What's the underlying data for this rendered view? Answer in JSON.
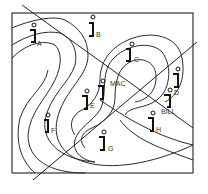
{
  "diagram": {
    "type": "contour map with positioned figures and cutting lines",
    "colors": {
      "stroke": "#222222",
      "background": "#ffffff"
    },
    "figures": [
      {
        "id": "A",
        "label": "A"
      },
      {
        "id": "B",
        "label": "B"
      },
      {
        "id": "C",
        "label": "C"
      },
      {
        "id": "D",
        "label": "D"
      },
      {
        "id": "E",
        "label": "E"
      },
      {
        "id": "F",
        "label": "F"
      },
      {
        "id": "G",
        "label": "G"
      },
      {
        "id": "H",
        "label": "H"
      },
      {
        "id": "MAC",
        "label": "MAC"
      },
      {
        "id": "BILL",
        "label": "BILL"
      }
    ],
    "lines": [
      "diagonal-line-1",
      "diagonal-line-2"
    ]
  }
}
